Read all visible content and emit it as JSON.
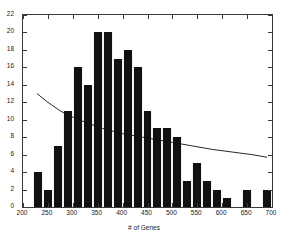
{
  "chart_data": {
    "type": "bar",
    "title": "",
    "subtitle": "",
    "xlabel": "# of Genes",
    "ylabel": "",
    "xlim": [
      200,
      700
    ],
    "ylim": [
      0,
      22
    ],
    "xticks": [
      200,
      250,
      300,
      350,
      400,
      450,
      500,
      550,
      600,
      650,
      700
    ],
    "yticks": [
      0,
      2,
      4,
      6,
      8,
      10,
      12,
      14,
      16,
      18,
      20,
      22
    ],
    "xtick_labels": [
      "200",
      "250",
      "300",
      "350",
      "400",
      "450",
      "500",
      "550",
      "600",
      "650",
      "700"
    ],
    "ytick_labels": [
      "0",
      "2",
      "4",
      "6",
      "8",
      "10",
      "12",
      "14",
      "16",
      "18",
      "20",
      "22"
    ],
    "grid": false,
    "legend": null,
    "bin_width": 20,
    "bar_color": "#111111",
    "bin_starts": [
      220,
      240,
      260,
      280,
      300,
      320,
      340,
      360,
      380,
      400,
      420,
      440,
      460,
      480,
      500,
      520,
      540,
      560,
      580,
      600,
      620,
      640,
      660,
      680
    ],
    "categories": [
      "220",
      "240",
      "260",
      "280",
      "300",
      "320",
      "340",
      "360",
      "380",
      "400",
      "420",
      "440",
      "460",
      "480",
      "500",
      "520",
      "540",
      "560",
      "580",
      "600",
      "620",
      "640",
      "660",
      "680"
    ],
    "values": [
      4,
      2,
      7,
      11,
      16,
      14,
      20,
      20,
      17,
      18,
      16,
      11,
      9,
      9,
      8,
      3,
      5,
      3,
      2,
      1,
      0,
      2,
      0,
      2
    ],
    "series": [
      {
        "name": "# of Genes histogram",
        "values": [
          4,
          2,
          7,
          11,
          16,
          14,
          20,
          20,
          17,
          18,
          16,
          11,
          9,
          9,
          8,
          3,
          5,
          3,
          2,
          1,
          0,
          2,
          0,
          2
        ]
      }
    ],
    "overlay_curve": {
      "name": "fitted decreasing trend",
      "type": "line",
      "color": "#111111",
      "x": [
        228,
        250,
        275,
        300,
        330,
        360,
        400,
        440,
        470,
        500,
        540,
        580,
        620,
        660,
        690
      ],
      "y": [
        13.0,
        12.0,
        11.0,
        10.3,
        9.6,
        9.0,
        8.4,
        8.0,
        7.7,
        7.4,
        7.0,
        6.6,
        6.3,
        6.0,
        5.7
      ]
    },
    "annotations": []
  }
}
